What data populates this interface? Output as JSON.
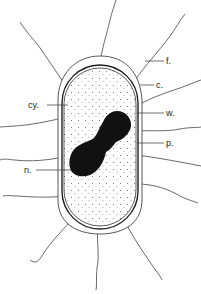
{
  "diagram": {
    "type": "bacterial-cell-structure",
    "colors": {
      "background": "#ffffff",
      "line": "#333333",
      "nucleoid": "#111111",
      "stipple": "#555555"
    },
    "labels": [
      {
        "id": "f",
        "text": "f.",
        "meaning_hint": "flagellum",
        "x": 166,
        "y": 64
      },
      {
        "id": "c",
        "text": "c.",
        "meaning_hint": "capsule",
        "x": 156,
        "y": 88
      },
      {
        "id": "w",
        "text": "w.",
        "meaning_hint": "cell wall",
        "x": 166,
        "y": 116
      },
      {
        "id": "p",
        "text": "p.",
        "meaning_hint": "plasma membrane",
        "x": 166,
        "y": 146
      },
      {
        "id": "cy",
        "text": "cy.",
        "meaning_hint": "cytoplasm",
        "x": 28,
        "y": 108
      },
      {
        "id": "n",
        "text": "n.",
        "meaning_hint": "nucleoid",
        "x": 24,
        "y": 173
      }
    ]
  }
}
